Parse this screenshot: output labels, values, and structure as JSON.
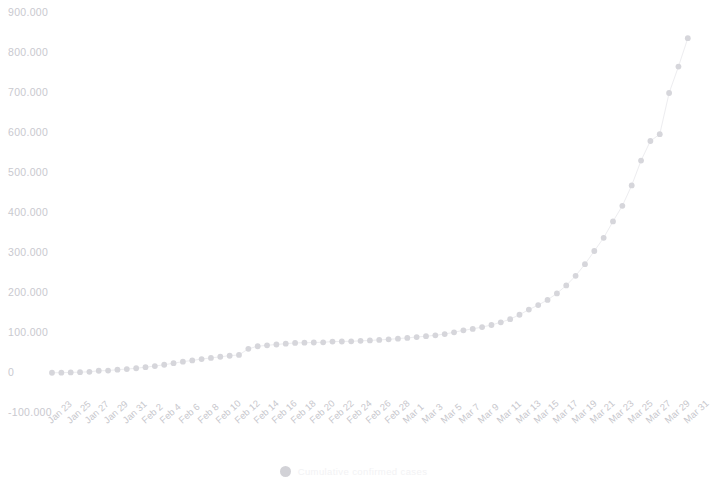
{
  "chart_data": {
    "type": "scatter",
    "title": "",
    "subtitle": "",
    "xlabel": "",
    "ylabel": "",
    "grid": false,
    "legend_position": "bottom",
    "legend": [
      {
        "name": "Cumulative confirmed cases",
        "color": "#d2d2d7",
        "marker": "circle"
      }
    ],
    "ylim": [
      -100000,
      900000
    ],
    "y_ticks": [
      -100000,
      0,
      100000,
      200000,
      300000,
      400000,
      500000,
      600000,
      700000,
      800000,
      900000
    ],
    "y_tick_labels": [
      "-100.000",
      "0",
      "100.000",
      "200.000",
      "300.000",
      "400.000",
      "500.000",
      "600.000",
      "700.000",
      "800.000",
      "900.000"
    ],
    "x_tick_labels": [
      "Jan 23",
      "Jan 25",
      "Jan 27",
      "Jan 29",
      "Jan 31",
      "Feb 2",
      "Feb 4",
      "Feb 6",
      "Feb 8",
      "Feb 10",
      "Feb 12",
      "Feb 14",
      "Feb 16",
      "Feb 18",
      "Feb 20",
      "Feb 22",
      "Feb 24",
      "Feb 26",
      "Feb 28",
      "Mar 1",
      "Mar 3",
      "Mar 5",
      "Mar 7",
      "Mar 9",
      "Mar 11",
      "Mar 13",
      "Mar 15",
      "Mar 17",
      "Mar 19",
      "Mar 21",
      "Mar 23",
      "Mar 25",
      "Mar 27",
      "Mar 29",
      "Mar 31"
    ],
    "x": [
      "Jan 23",
      "Jan 24",
      "Jan 25",
      "Jan 26",
      "Jan 27",
      "Jan 28",
      "Jan 29",
      "Jan 30",
      "Jan 31",
      "Feb 1",
      "Feb 2",
      "Feb 3",
      "Feb 4",
      "Feb 5",
      "Feb 6",
      "Feb 7",
      "Feb 8",
      "Feb 9",
      "Feb 10",
      "Feb 11",
      "Feb 12",
      "Feb 13",
      "Feb 14",
      "Feb 15",
      "Feb 16",
      "Feb 17",
      "Feb 18",
      "Feb 19",
      "Feb 20",
      "Feb 21",
      "Feb 22",
      "Feb 23",
      "Feb 24",
      "Feb 25",
      "Feb 26",
      "Feb 27",
      "Feb 28",
      "Feb 29",
      "Mar 1",
      "Mar 2",
      "Mar 3",
      "Mar 4",
      "Mar 5",
      "Mar 6",
      "Mar 7",
      "Mar 8",
      "Mar 9",
      "Mar 10",
      "Mar 11",
      "Mar 12",
      "Mar 13",
      "Mar 14",
      "Mar 15",
      "Mar 16",
      "Mar 17",
      "Mar 18",
      "Mar 19",
      "Mar 20",
      "Mar 21",
      "Mar 22",
      "Mar 23",
      "Mar 24",
      "Mar 25",
      "Mar 26",
      "Mar 27",
      "Mar 28",
      "Mar 29",
      "Mar 30",
      "Mar 31"
    ],
    "values": [
      600,
      900,
      1400,
      2100,
      2900,
      5600,
      6100,
      8200,
      9800,
      11900,
      14600,
      17400,
      20600,
      24500,
      28300,
      31500,
      34900,
      37600,
      40600,
      43100,
      45200,
      60400,
      66900,
      69200,
      71300,
      73300,
      75200,
      75700,
      76200,
      76800,
      78600,
      78800,
      79300,
      80400,
      81400,
      82800,
      84100,
      85900,
      87700,
      89900,
      92000,
      94300,
      97400,
      101800,
      106700,
      110300,
      114800,
      120000,
      126700,
      134600,
      145600,
      158500,
      169700,
      182800,
      199000,
      219000,
      243000,
      272000,
      305000,
      338000,
      379000,
      418000,
      469000,
      531000,
      580000,
      597000,
      700000,
      766000,
      837000
    ],
    "marker_color": "#d6d6db",
    "line_color": "#ededf0",
    "axis_color": "#eeeef1"
  }
}
